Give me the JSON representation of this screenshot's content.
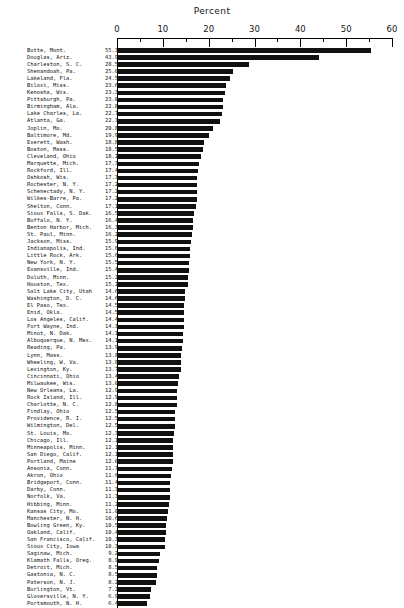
{
  "chart_data": {
    "type": "bar",
    "orientation": "horizontal",
    "title": "Percent",
    "xlabel": "Percent",
    "ylabel": "",
    "xlim": [
      0,
      60
    ],
    "grid": false,
    "legend": null,
    "bar_color": "#111111",
    "major_ticks": [
      0,
      10,
      20,
      30,
      40,
      50,
      60
    ],
    "minor_ticks": [
      5,
      15,
      25,
      35,
      45,
      55
    ],
    "tick_labels": [
      "0",
      "10",
      "20",
      "30",
      "40",
      "50",
      "60"
    ],
    "categories": [
      "Butte, Mont.",
      "Douglas, Ariz.",
      "Charleston, S. C.",
      "Shenandoah, Pa.",
      "Lakeland, Fla.",
      "Biloxi, Miss.",
      "Kenosha, Wis.",
      "Pittsburgh, Pa.",
      "Birmingham, Ala.",
      "Lake Charles, La.",
      "Atlanta, Ga.",
      "Joplin, Mo.",
      "Baltimore, Md.",
      "Everett, Wash.",
      "Boston, Mass.",
      "Cleveland, Ohio",
      "Marquette, Mich.",
      "Rockford, Ill.",
      "Oshkosh, Wis.",
      "Rochester, N. Y.",
      "Schenectady, N. Y.",
      "Wilkes-Barre, Pa.",
      "Shelton, Conn.",
      "Sioux Falls, S. Dak.",
      "Buffalo, N. Y.",
      "Benton Harbor, Mich.",
      "St. Paul, Minn.",
      "Jackson, Miss.",
      "Indianapolis, Ind.",
      "Little Rock, Ark.",
      "New York, N. Y.",
      "Evansville, Ind.",
      "Duluth, Minn.",
      "Houston, Tex.",
      "Salt Lake City, Utah",
      "Washington, D. C.",
      "El Paso, Tex.",
      "Enid, Okla.",
      "Los Angeles, Calif.",
      "Fort Wayne, Ind.",
      "Minot, N. Dak.",
      "Albuquerque, N. Mex.",
      "Reading, Pa.",
      "Lynn, Mass.",
      "Wheeling, W. Va.",
      "Lexington, Ky.",
      "Cincinnati, Ohio",
      "Milwaukee, Wis.",
      "New Orleans, La.",
      "Rock Island, Ill.",
      "Charlotte, N. C.",
      "Findlay, Ohio",
      "Providence, R. I.",
      "Wilmington, Del.",
      "St. Louis, Mo.",
      "Chicago, Ill.",
      "Minneapolis, Minn.",
      "San Diego, Calif.",
      "Portland, Maine",
      "Ansonia, Conn.",
      "Akron, Ohio",
      "Bridgeport, Conn.",
      "Darby, Conn.",
      "Norfolk, Va.",
      "Hibbing, Minn.",
      "Kansas City, Mo.",
      "Manchester, N. H.",
      "Bowling Green, Ky.",
      "Oakland, Calif.",
      "San Francisco, Calif.",
      "Sioux City, Iowa",
      "Saginaw, Mich.",
      "Klamath Falls, Oreg.",
      "Detroit, Mich.",
      "Gastonia, N. C.",
      "Paterson, N. J.",
      "Burlington, Vt.",
      "Gloversville, N. Y.",
      "Portsmouth, N. H."
    ],
    "values": [
      55.3,
      43.9,
      28.5,
      25.0,
      24.5,
      23.6,
      23.3,
      23.0,
      22.8,
      22.7,
      22.3,
      20.8,
      19.9,
      18.8,
      18.5,
      18.2,
      17.7,
      17.4,
      17.3,
      17.2,
      17.2,
      17.2,
      17.1,
      16.5,
      16.4,
      16.3,
      16.2,
      15.9,
      15.6,
      15.6,
      15.5,
      15.4,
      15.2,
      15.2,
      14.6,
      14.6,
      14.5,
      14.5,
      14.4,
      14.3,
      14.1,
      14.1,
      13.9,
      13.8,
      13.8,
      13.7,
      13.4,
      13.0,
      12.9,
      12.9,
      12.8,
      12.5,
      12.5,
      12.5,
      12.3,
      12.1,
      12.1,
      12.1,
      12.0,
      11.7,
      11.6,
      11.4,
      11.3,
      11.3,
      11.2,
      11.0,
      10.6,
      10.5,
      10.4,
      10.3,
      10.3,
      9.2,
      8.9,
      8.5,
      8.5,
      8.2,
      7.2,
      6.9,
      6.4
    ],
    "value_labels": [
      "55.3",
      "43.9",
      "28.5",
      "25.0",
      "24.5",
      "23.6",
      "23.3",
      "23.0",
      "22.8",
      "22.7",
      "22.3",
      "20.8",
      "19.9",
      "18.8",
      "18.5",
      "18.2",
      "17.7",
      "17.4",
      "17.3",
      "17.2",
      "17.2",
      "17.2",
      "17.1",
      "16.5",
      "16.4",
      "16.3",
      "16.2",
      "15.9",
      "15.6",
      "15.6",
      "15.5",
      "15.4",
      "15.2",
      "15.2",
      "14.6",
      "14.6",
      "14.5",
      "14.5",
      "14.4",
      "14.3",
      "14.1",
      "14.1",
      "13.9",
      "13.8",
      "13.8",
      "13.7",
      "13.4",
      "13.0",
      "12.9",
      "12.9",
      "12.8",
      "12.5",
      "12.5",
      "12.5",
      "12.3",
      "12.1",
      "12.1",
      "12.1",
      "12.0",
      "11.7",
      "11.6",
      "11.4",
      "11.3",
      "11.3",
      "11.2",
      "11.0",
      "10.6",
      "10.5",
      "10.4",
      "10.3",
      "10.3",
      "9.2",
      "8.9",
      "8.5",
      "8.5",
      "8.2",
      "7.2",
      "6.9",
      "6.4"
    ]
  }
}
